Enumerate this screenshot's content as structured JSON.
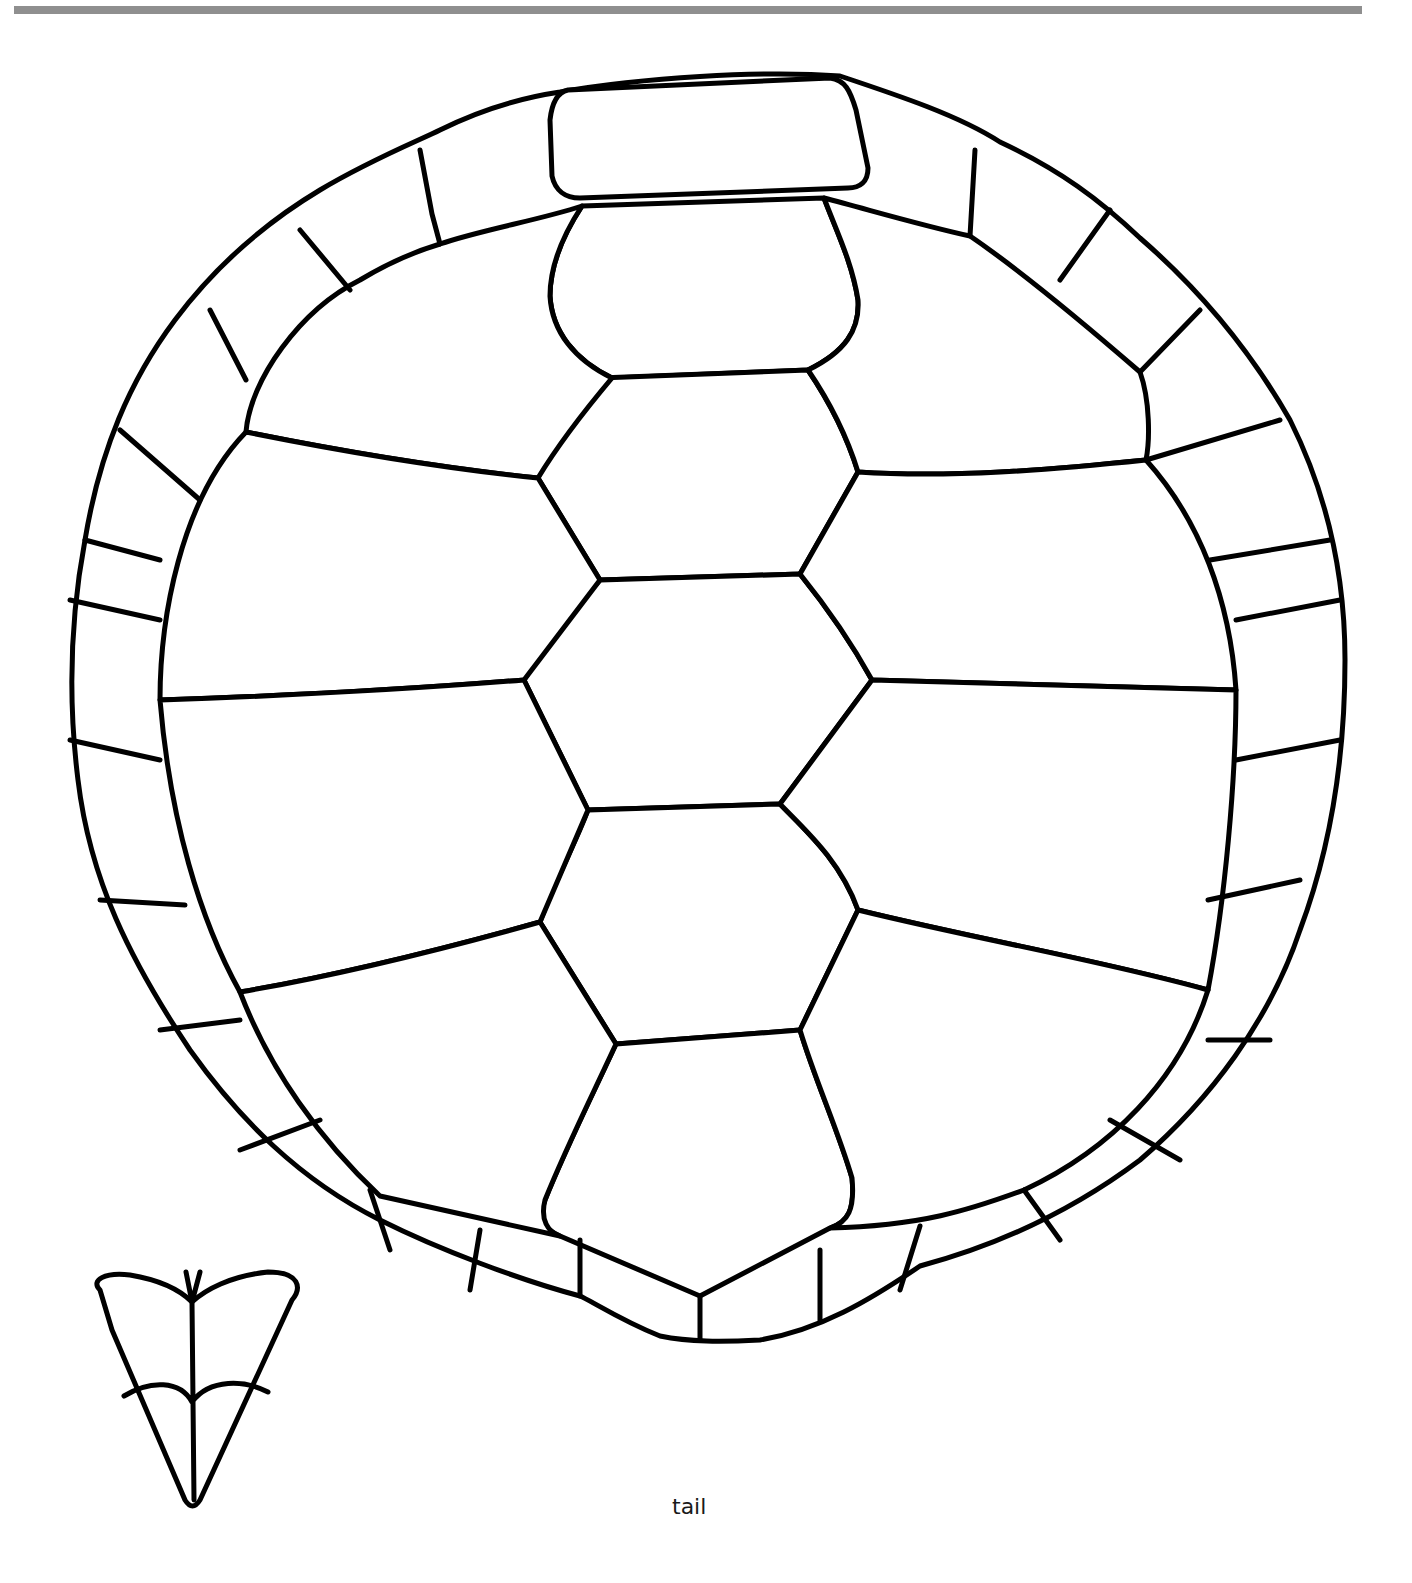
{
  "header": {
    "rule_color": "#8f8f8f"
  },
  "diagram": {
    "stroke_color": "#000000",
    "background": "#ffffff",
    "scute_groups": {
      "nuchal": 1,
      "vertebral": 5,
      "costal_left": 4,
      "costal_right": 4,
      "marginal_left": 11,
      "marginal_right": 11,
      "supracaudal": 2
    }
  },
  "labels": {
    "tail": "tail"
  },
  "icons": {
    "orientation_marker": "tail-arrow-icon"
  }
}
